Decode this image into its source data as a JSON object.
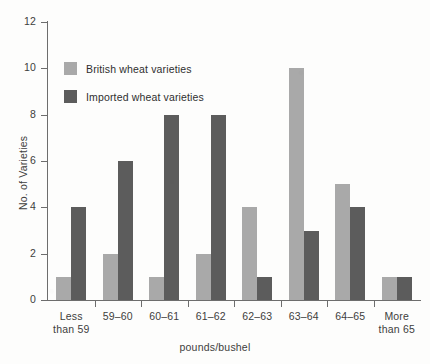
{
  "chart_data": {
    "type": "bar",
    "title": "",
    "subtitle": "",
    "xlabel": "pounds/bushel",
    "ylabel": "No. of Varieties",
    "categories": [
      "Less than 59",
      "59–60",
      "60–61",
      "61–62",
      "62–63",
      "63–64",
      "64–65",
      "More than 65"
    ],
    "category_lines": [
      [
        "Less",
        "than 59"
      ],
      [
        "59–60",
        ""
      ],
      [
        "60–61",
        ""
      ],
      [
        "61–62",
        ""
      ],
      [
        "62–63",
        ""
      ],
      [
        "63–64",
        ""
      ],
      [
        "64–65",
        ""
      ],
      [
        "More",
        "than 65"
      ]
    ],
    "series": [
      {
        "name": "British wheat varieties",
        "color": "#a9a9a9",
        "values": [
          1,
          2,
          1,
          2,
          4,
          10,
          5,
          1
        ]
      },
      {
        "name": "Imported wheat varieties",
        "color": "#5c5c5c",
        "values": [
          4,
          6,
          8,
          8,
          1,
          3,
          4,
          1
        ]
      }
    ],
    "ylim": [
      0,
      12
    ],
    "yticks": [
      0,
      2,
      4,
      6,
      8,
      10,
      12
    ],
    "ytick_labels": [
      "0",
      "2",
      "4",
      "6",
      "8",
      "10",
      "12"
    ],
    "grid": false,
    "legend_position": "upper-left-inside",
    "bar_mode": "grouped"
  },
  "legend": {
    "entries": [
      {
        "label": "British wheat varieties",
        "color": "#a9a9a9"
      },
      {
        "label": "Imported wheat varieties",
        "color": "#5c5c5c"
      }
    ]
  },
  "axes": {
    "y_title": "No. of Varieties",
    "x_title": "pounds/bushel"
  },
  "colors": {
    "british": "#a9a9a9",
    "imported": "#5c5c5c",
    "axis": "#6d6d6d",
    "text": "#3d3d3d",
    "background": "#fdfdfc"
  }
}
